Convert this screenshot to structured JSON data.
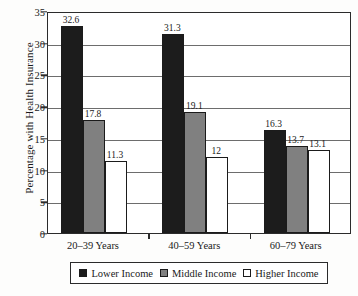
{
  "chart_data": {
    "type": "bar",
    "title": "",
    "xlabel": "",
    "ylabel": "Percentage with Health Insurance",
    "categories": [
      "20–39 Years",
      "40–59 Years",
      "60–79 Years"
    ],
    "series": [
      {
        "name": "Lower Income",
        "color": "#1c1c1c",
        "values": [
          32.6,
          31.3,
          16.3
        ],
        "labels": [
          "32.6",
          "31.3",
          "16.3"
        ]
      },
      {
        "name": "Middle Income",
        "color": "#808080",
        "values": [
          17.8,
          19.1,
          13.7
        ],
        "labels": [
          "17.8",
          "19.1",
          "13.7"
        ]
      },
      {
        "name": "Higher Income",
        "color": "#ffffff",
        "values": [
          11.3,
          12.0,
          13.1
        ],
        "labels": [
          "11.3",
          "12",
          "13.1"
        ]
      }
    ],
    "ylim": [
      0,
      35
    ],
    "yticks": [
      0,
      5,
      10,
      15,
      20,
      25,
      30,
      35
    ],
    "ytick_labels": [
      "0",
      "5",
      "10",
      "15",
      "20",
      "25",
      "30",
      "35"
    ],
    "grid": true,
    "legend_position": "bottom"
  },
  "legend": {
    "entries": [
      {
        "label": "Lower Income"
      },
      {
        "label": "Middle Income"
      },
      {
        "label": "Higher Income"
      }
    ]
  }
}
